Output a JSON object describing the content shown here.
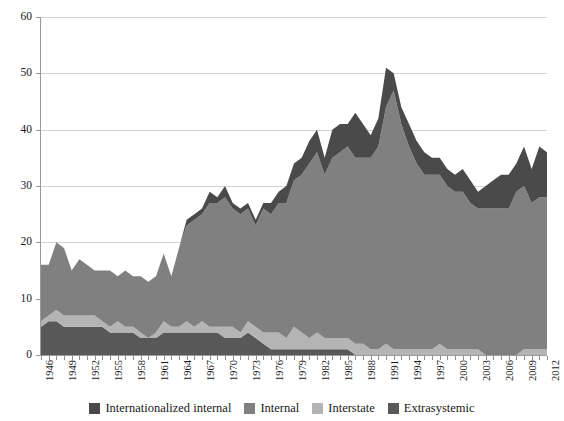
{
  "chart_data": {
    "type": "area",
    "stacked": true,
    "title": "",
    "subtitle": "",
    "xlabel": "",
    "ylabel": "",
    "xlim": [
      1946,
      2012
    ],
    "ylim": [
      0,
      60
    ],
    "yticks": [
      0,
      10,
      20,
      30,
      40,
      50,
      60
    ],
    "ytick_labels": [
      "0",
      "10",
      "20",
      "30",
      "40",
      "50",
      "60"
    ],
    "grid": "horizontal",
    "legend_position": "bottom-center",
    "x": [
      1946,
      1947,
      1948,
      1949,
      1950,
      1951,
      1952,
      1953,
      1954,
      1955,
      1956,
      1957,
      1958,
      1959,
      1960,
      1961,
      1962,
      1963,
      1964,
      1965,
      1966,
      1967,
      1968,
      1969,
      1970,
      1971,
      1972,
      1973,
      1974,
      1975,
      1976,
      1977,
      1978,
      1979,
      1980,
      1981,
      1982,
      1983,
      1984,
      1985,
      1986,
      1987,
      1988,
      1989,
      1990,
      1991,
      1992,
      1993,
      1994,
      1995,
      1996,
      1997,
      1998,
      1999,
      2000,
      2001,
      2002,
      2003,
      2004,
      2005,
      2006,
      2007,
      2008,
      2009,
      2010,
      2011,
      2012
    ],
    "xtick_labels": [
      "1946",
      "1949",
      "1952",
      "1955",
      "1958",
      "1961",
      "1964",
      "1967",
      "1970",
      "1973",
      "1976",
      "1979",
      "1982",
      "1985",
      "1988",
      "1991",
      "1994",
      "1997",
      "2000",
      "2003",
      "2006",
      "2009",
      "2012"
    ],
    "series": [
      {
        "name": "Extrasystemic",
        "color": "#585858",
        "stack_order": 1,
        "values": [
          5,
          6,
          6,
          5,
          5,
          5,
          5,
          5,
          5,
          4,
          4,
          4,
          4,
          3,
          3,
          3,
          4,
          4,
          4,
          4,
          4,
          4,
          4,
          4,
          3,
          3,
          3,
          4,
          3,
          2,
          1,
          1,
          1,
          1,
          1,
          1,
          1,
          1,
          1,
          1,
          1,
          0,
          0,
          0,
          0,
          0,
          0,
          0,
          0,
          0,
          0,
          0,
          0,
          0,
          0,
          0,
          0,
          0,
          0,
          0,
          0,
          0,
          0,
          0,
          0,
          0,
          0
        ]
      },
      {
        "name": "Interstate",
        "color": "#b4b4b4",
        "stack_order": 2,
        "values": [
          1,
          1,
          2,
          2,
          2,
          2,
          2,
          2,
          1,
          1,
          2,
          1,
          1,
          1,
          0,
          1,
          2,
          1,
          1,
          2,
          1,
          2,
          1,
          1,
          2,
          2,
          1,
          2,
          2,
          2,
          3,
          3,
          2,
          4,
          3,
          2,
          3,
          2,
          2,
          2,
          2,
          2,
          2,
          1,
          1,
          2,
          1,
          1,
          1,
          1,
          1,
          1,
          2,
          1,
          1,
          1,
          1,
          1,
          0,
          0,
          0,
          0,
          0,
          1,
          1,
          1,
          1
        ]
      },
      {
        "name": "Internal",
        "color": "#808080",
        "stack_order": 3,
        "values": [
          10,
          9,
          12,
          12,
          8,
          10,
          9,
          8,
          9,
          10,
          8,
          10,
          9,
          10,
          10,
          10,
          12,
          9,
          14,
          17,
          19,
          19,
          22,
          22,
          23,
          21,
          21,
          20,
          18,
          22,
          21,
          23,
          24,
          26,
          28,
          31,
          32,
          29,
          32,
          33,
          34,
          33,
          33,
          34,
          36,
          42,
          46,
          40,
          36,
          33,
          31,
          31,
          30,
          29,
          28,
          28,
          26,
          25,
          26,
          26,
          26,
          26,
          29,
          29,
          26,
          27,
          27
        ]
      },
      {
        "name": "Internationalized internal",
        "color": "#4a4a4a",
        "stack_order": 4,
        "values": [
          0,
          0,
          0,
          0,
          0,
          0,
          0,
          0,
          0,
          0,
          0,
          0,
          0,
          0,
          0,
          0,
          0,
          0,
          0,
          1,
          1,
          1,
          2,
          1,
          2,
          1,
          1,
          1,
          1,
          1,
          2,
          2,
          3,
          3,
          3,
          4,
          4,
          3,
          5,
          5,
          4,
          8,
          6,
          4,
          5,
          7,
          3,
          3,
          4,
          4,
          4,
          3,
          3,
          3,
          3,
          4,
          4,
          3,
          4,
          5,
          6,
          6,
          5,
          7,
          6,
          9,
          8
        ]
      }
    ]
  },
  "legend": {
    "items": [
      {
        "label": "Internationalized internal",
        "color": "#4a4a4a"
      },
      {
        "label": "Internal",
        "color": "#808080"
      },
      {
        "label": "Interstate",
        "color": "#b4b4b4"
      },
      {
        "label": "Extrasystemic",
        "color": "#585858"
      }
    ]
  },
  "axes": {
    "y_tick_labels": [
      "0",
      "10",
      "20",
      "30",
      "40",
      "50",
      "60"
    ],
    "x_tick_labels": [
      "1946",
      "1949",
      "1952",
      "1955",
      "1958",
      "1961",
      "1964",
      "1967",
      "1970",
      "1973",
      "1976",
      "1979",
      "1982",
      "1985",
      "1988",
      "1991",
      "1994",
      "1997",
      "2000",
      "2003",
      "2006",
      "2009",
      "2012"
    ]
  }
}
